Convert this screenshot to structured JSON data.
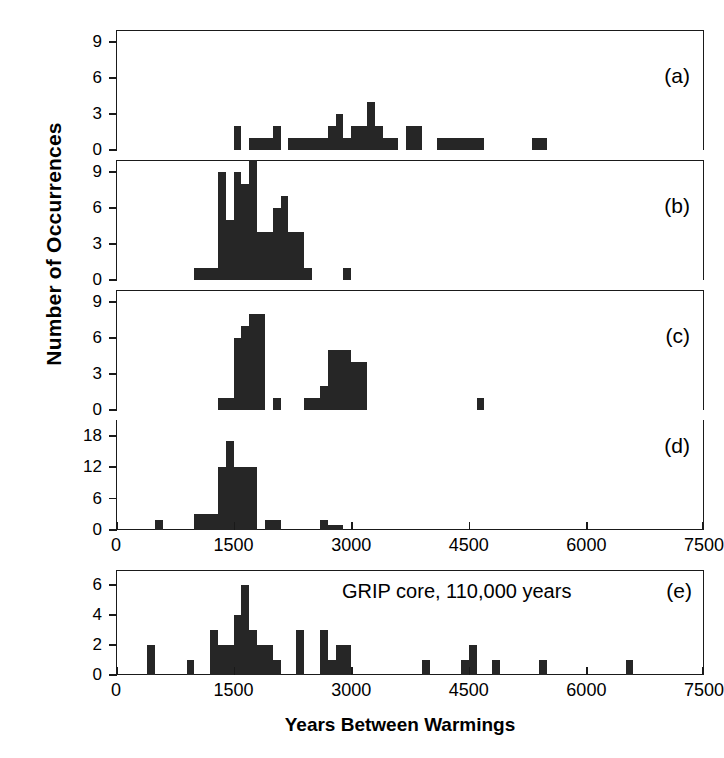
{
  "figure": {
    "xlabel": "Years Between Warmings",
    "ylabel": "Number of Occurrences",
    "annotation": "GRIP core, 110,000 years"
  },
  "panel_labels": {
    "a": "(a)",
    "b": "(b)",
    "c": "(c)",
    "d": "(d)",
    "e": "(e)"
  },
  "xticks": {
    "t0": "0",
    "t1": "1500",
    "t2": "3000",
    "t3": "4500",
    "t4": "6000",
    "t5": "7500"
  },
  "yticks_abc": {
    "y0": "0",
    "y1": "3",
    "y2": "6",
    "y3": "9"
  },
  "yticks_d": {
    "y0": "0",
    "y1": "6",
    "y2": "12",
    "y3": "18"
  },
  "yticks_e": {
    "y0": "0",
    "y1": "2",
    "y2": "4",
    "y3": "6"
  },
  "colors": {
    "bar": "#262626",
    "axis": "#1a1a1a",
    "background": "#ffffff"
  },
  "chart_data": {
    "type": "bar",
    "title": "",
    "xlabel": "Years Between Warmings",
    "ylabel": "Number of Occurrences",
    "xlim": [
      0,
      7500
    ],
    "grid": false,
    "legend": null,
    "bin_width": 100,
    "panels": [
      {
        "id": "a",
        "label": "(a)",
        "ylim": [
          0,
          10
        ],
        "ytick_values": [
          0,
          3,
          6,
          9
        ],
        "bins": [
          {
            "x": 1500,
            "value": 2
          },
          {
            "x": 1700,
            "value": 1
          },
          {
            "x": 1800,
            "value": 1
          },
          {
            "x": 1900,
            "value": 1
          },
          {
            "x": 2000,
            "value": 2
          },
          {
            "x": 2200,
            "value": 1
          },
          {
            "x": 2300,
            "value": 1
          },
          {
            "x": 2400,
            "value": 1
          },
          {
            "x": 2500,
            "value": 1
          },
          {
            "x": 2600,
            "value": 1
          },
          {
            "x": 2700,
            "value": 2
          },
          {
            "x": 2800,
            "value": 3
          },
          {
            "x": 2900,
            "value": 1
          },
          {
            "x": 3000,
            "value": 2
          },
          {
            "x": 3100,
            "value": 2
          },
          {
            "x": 3200,
            "value": 4
          },
          {
            "x": 3300,
            "value": 2
          },
          {
            "x": 3400,
            "value": 1
          },
          {
            "x": 3500,
            "value": 1
          },
          {
            "x": 3700,
            "value": 2
          },
          {
            "x": 3800,
            "value": 2
          },
          {
            "x": 4100,
            "value": 1
          },
          {
            "x": 4200,
            "value": 1
          },
          {
            "x": 4300,
            "value": 1
          },
          {
            "x": 4400,
            "value": 1
          },
          {
            "x": 4500,
            "value": 1
          },
          {
            "x": 4600,
            "value": 1
          },
          {
            "x": 5300,
            "value": 1
          },
          {
            "x": 5400,
            "value": 1
          }
        ]
      },
      {
        "id": "b",
        "label": "(b)",
        "ylim": [
          0,
          10
        ],
        "ytick_values": [
          0,
          3,
          6,
          9
        ],
        "bins": [
          {
            "x": 1000,
            "value": 1
          },
          {
            "x": 1100,
            "value": 1
          },
          {
            "x": 1200,
            "value": 1
          },
          {
            "x": 1300,
            "value": 9
          },
          {
            "x": 1400,
            "value": 5
          },
          {
            "x": 1500,
            "value": 9
          },
          {
            "x": 1600,
            "value": 8
          },
          {
            "x": 1700,
            "value": 10
          },
          {
            "x": 1800,
            "value": 4
          },
          {
            "x": 1900,
            "value": 4
          },
          {
            "x": 2000,
            "value": 6
          },
          {
            "x": 2100,
            "value": 7
          },
          {
            "x": 2200,
            "value": 4
          },
          {
            "x": 2300,
            "value": 4
          },
          {
            "x": 2400,
            "value": 1
          },
          {
            "x": 2900,
            "value": 1
          }
        ]
      },
      {
        "id": "c",
        "label": "(c)",
        "ylim": [
          0,
          10
        ],
        "ytick_values": [
          0,
          3,
          6,
          9
        ],
        "bins": [
          {
            "x": 1300,
            "value": 1
          },
          {
            "x": 1400,
            "value": 1
          },
          {
            "x": 1500,
            "value": 6
          },
          {
            "x": 1600,
            "value": 7
          },
          {
            "x": 1700,
            "value": 8
          },
          {
            "x": 1800,
            "value": 8
          },
          {
            "x": 2000,
            "value": 1
          },
          {
            "x": 2400,
            "value": 1
          },
          {
            "x": 2500,
            "value": 1
          },
          {
            "x": 2600,
            "value": 2
          },
          {
            "x": 2700,
            "value": 5
          },
          {
            "x": 2800,
            "value": 5
          },
          {
            "x": 2900,
            "value": 5
          },
          {
            "x": 3000,
            "value": 4
          },
          {
            "x": 3100,
            "value": 4
          },
          {
            "x": 4600,
            "value": 1
          }
        ]
      },
      {
        "id": "d",
        "label": "(d)",
        "ylim": [
          0,
          21
        ],
        "ytick_values": [
          0,
          6,
          12,
          18
        ],
        "bins": [
          {
            "x": 500,
            "value": 2
          },
          {
            "x": 1000,
            "value": 3
          },
          {
            "x": 1100,
            "value": 3
          },
          {
            "x": 1200,
            "value": 3
          },
          {
            "x": 1300,
            "value": 12
          },
          {
            "x": 1400,
            "value": 17
          },
          {
            "x": 1500,
            "value": 12
          },
          {
            "x": 1600,
            "value": 12
          },
          {
            "x": 1700,
            "value": 12
          },
          {
            "x": 1900,
            "value": 2
          },
          {
            "x": 2000,
            "value": 2
          },
          {
            "x": 2600,
            "value": 2
          },
          {
            "x": 2700,
            "value": 1
          },
          {
            "x": 2800,
            "value": 1
          }
        ]
      },
      {
        "id": "e",
        "label": "(e)",
        "ylim": [
          0,
          7
        ],
        "ytick_values": [
          0,
          2,
          4,
          6
        ],
        "annotation": "GRIP core, 110,000 years",
        "bins": [
          {
            "x": 400,
            "value": 2
          },
          {
            "x": 900,
            "value": 1
          },
          {
            "x": 1200,
            "value": 3
          },
          {
            "x": 1300,
            "value": 2
          },
          {
            "x": 1400,
            "value": 2
          },
          {
            "x": 1500,
            "value": 4
          },
          {
            "x": 1600,
            "value": 6
          },
          {
            "x": 1700,
            "value": 3
          },
          {
            "x": 1800,
            "value": 2
          },
          {
            "x": 1900,
            "value": 2
          },
          {
            "x": 2000,
            "value": 1
          },
          {
            "x": 2300,
            "value": 3
          },
          {
            "x": 2600,
            "value": 3
          },
          {
            "x": 2700,
            "value": 1
          },
          {
            "x": 2800,
            "value": 2
          },
          {
            "x": 2900,
            "value": 2
          },
          {
            "x": 3900,
            "value": 1
          },
          {
            "x": 4400,
            "value": 1
          },
          {
            "x": 4500,
            "value": 2
          },
          {
            "x": 4800,
            "value": 1
          },
          {
            "x": 5400,
            "value": 1
          },
          {
            "x": 6500,
            "value": 1
          }
        ]
      }
    ]
  }
}
